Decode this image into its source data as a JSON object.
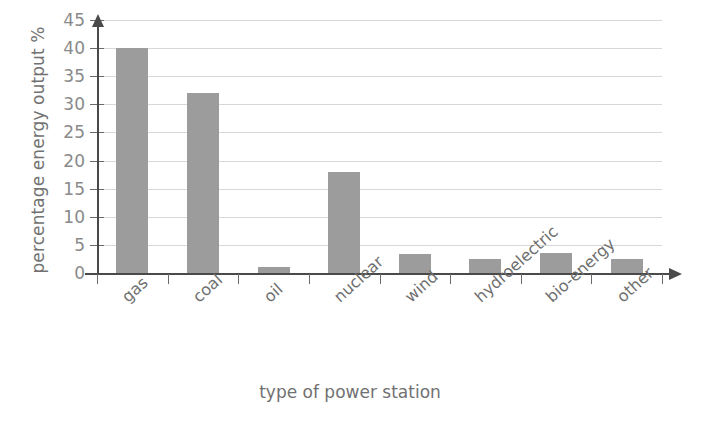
{
  "chart_data": {
    "type": "bar",
    "title": "",
    "xlabel": "type of power station",
    "ylabel": "percentage energy output %",
    "categories": [
      "gas",
      "coal",
      "oil",
      "nuclear",
      "wind",
      "hydroelectric",
      "bio-energy",
      "other"
    ],
    "values": [
      40,
      32,
      1,
      18,
      3.3,
      2.5,
      3.5,
      2.5
    ],
    "ylim": [
      0,
      45
    ],
    "ytick_labels": [
      "0",
      "5",
      "10",
      "15",
      "20",
      "25",
      "30",
      "35",
      "40",
      "45"
    ],
    "ytick_values": [
      0,
      5,
      10,
      15,
      20,
      25,
      30,
      35,
      40,
      45
    ],
    "grid": true,
    "legend": false,
    "bar_color": "#9c9c9c",
    "gridline_color": "#d8d8d8",
    "axis_color": "#4a4a4a",
    "text_color": "#6f6f6f",
    "background": "#ffffff"
  }
}
